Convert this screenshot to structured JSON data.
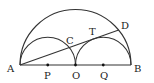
{
  "diagram": {
    "type": "geometry",
    "stroke_color": "#333333",
    "labels": {
      "A": "A",
      "B": "B",
      "C": "C",
      "D": "D",
      "T": "T",
      "O": "O",
      "P": "P",
      "Q": "Q"
    },
    "points": {
      "A": [
        20,
        65
      ],
      "B": [
        131,
        65
      ],
      "O": [
        75.5,
        65
      ],
      "P": [
        47.75,
        65
      ],
      "Q": [
        103.25,
        65
      ],
      "C": [
        69.3,
        47.6
      ],
      "T": [
        94.0,
        38.8
      ],
      "D": [
        118.7,
        30.1
      ]
    }
  }
}
